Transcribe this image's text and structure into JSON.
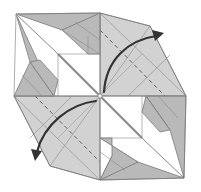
{
  "diagram": {
    "colors": {
      "paper": "#c4c4c4",
      "flap": "#b9b9b9",
      "background": "#ffffff",
      "arrow": "#333333",
      "crease": "#8a8a8a"
    },
    "symbols": [
      {
        "type": "valley-fold-line",
        "location": "upper-right"
      },
      {
        "type": "valley-fold-line",
        "location": "lower-left"
      },
      {
        "type": "fold-arrow",
        "direction": "center-to-upper-right"
      },
      {
        "type": "fold-arrow",
        "direction": "center-to-lower-left"
      }
    ]
  }
}
